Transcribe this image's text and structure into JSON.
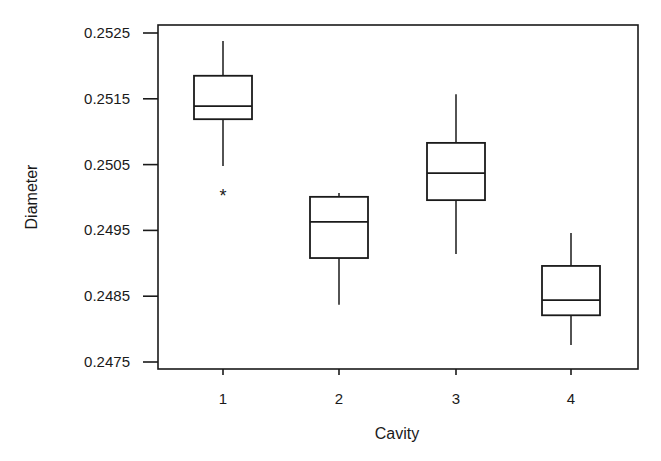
{
  "chart_data": {
    "type": "boxplot",
    "title": "",
    "xlabel": "Cavity",
    "ylabel": "Diameter",
    "categories": [
      "1",
      "2",
      "3",
      "4"
    ],
    "yticks": [
      "0.2525",
      "0.2515",
      "0.2505",
      "0.2495",
      "0.2485",
      "0.2475"
    ],
    "ytick_values": [
      0.2525,
      0.2515,
      0.2505,
      0.2495,
      0.2485,
      0.2475
    ],
    "ylim": [
      0.2474,
      0.25305
    ],
    "grid": false,
    "legend": null,
    "boxes": [
      {
        "category": "1",
        "whisker_high": 0.25238,
        "q3": 0.25185,
        "median": 0.25139,
        "q1": 0.25119,
        "whisker_low": 0.25048,
        "outliers": [
          0.25007
        ]
      },
      {
        "category": "2",
        "whisker_high": 0.25007,
        "q3": 0.25001,
        "median": 0.24963,
        "q1": 0.24908,
        "whisker_low": 0.24837,
        "outliers": []
      },
      {
        "category": "3",
        "whisker_high": 0.25157,
        "q3": 0.25083,
        "median": 0.25037,
        "q1": 0.24996,
        "whisker_low": 0.24914,
        "outliers": []
      },
      {
        "category": "4",
        "whisker_high": 0.24946,
        "q3": 0.24896,
        "median": 0.24844,
        "q1": 0.24821,
        "whisker_low": 0.24776,
        "outliers": []
      }
    ],
    "outlier_marker": "*"
  }
}
